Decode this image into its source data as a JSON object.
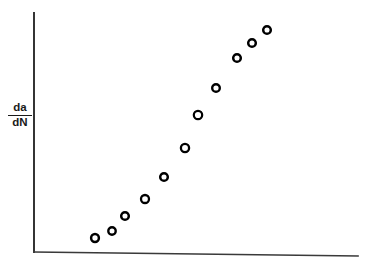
{
  "figure": {
    "background_color": "#ffffff",
    "axis_color": "#2b2b2b",
    "marker_color": "#000000",
    "marker_fill": "#ffffff",
    "y_axis_label_numerator": "da",
    "y_axis_label_denominator": "dN"
  },
  "chart_data": {
    "type": "scatter",
    "title": "",
    "subtitle": "",
    "xlabel": "",
    "ylabel": "da/dN",
    "legend": [],
    "annotations": [],
    "grid": false,
    "xticks": [],
    "yticks": [],
    "xtick_labels": [],
    "ytick_labels": [],
    "xlim": [
      0,
      100
    ],
    "ylim": [
      0,
      100
    ],
    "axis_style": "two-spine L-shaped open axes, no ticks, no tick labels",
    "marker_style": "open circle (ring) with black edge and white fill",
    "marker_radius_px": 4,
    "n_points": 11,
    "points": [
      {
        "x": 18.9,
        "y": 5.9
      },
      {
        "x": 24.1,
        "y": 8.8
      },
      {
        "x": 28.1,
        "y": 15.1
      },
      {
        "x": 34.3,
        "y": 22.2
      },
      {
        "x": 40.2,
        "y": 31.4
      },
      {
        "x": 46.6,
        "y": 43.5
      },
      {
        "x": 50.7,
        "y": 57.3
      },
      {
        "x": 56.3,
        "y": 68.6
      },
      {
        "x": 62.8,
        "y": 81.2
      },
      {
        "x": 67.5,
        "y": 87.4
      },
      {
        "x": 72.2,
        "y": 92.9
      }
    ],
    "x_values": [
      18.9,
      24.1,
      28.1,
      34.3,
      40.2,
      46.6,
      50.7,
      56.3,
      62.8,
      67.5,
      72.2
    ],
    "y_values": [
      5.9,
      8.8,
      15.1,
      22.2,
      31.4,
      43.5,
      57.3,
      68.6,
      81.2,
      87.4,
      92.9
    ],
    "pixel_points": [
      {
        "px": 95,
        "py": 238
      },
      {
        "px": 112,
        "py": 231
      },
      {
        "px": 125,
        "py": 216
      },
      {
        "px": 145,
        "py": 199
      },
      {
        "px": 164,
        "py": 177
      },
      {
        "px": 185,
        "py": 148
      },
      {
        "px": 198,
        "py": 115
      },
      {
        "px": 216,
        "py": 88
      },
      {
        "px": 237,
        "py": 58
      },
      {
        "px": 252,
        "py": 43
      },
      {
        "px": 267,
        "py": 30
      }
    ],
    "axes_geometry": {
      "y_axis_x": 34,
      "y_axis_top": 13,
      "y_axis_bottom": 252,
      "x_axis_left_x": 34,
      "x_axis_left_y": 252,
      "x_axis_right_x": 358,
      "x_axis_right_y": 256
    }
  }
}
